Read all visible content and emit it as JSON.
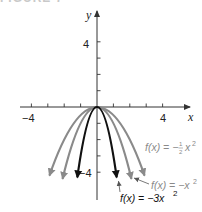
{
  "header": {
    "title": "FIGURE 7"
  },
  "colors": {
    "axis": "#333333",
    "dark_curve": "#111111",
    "gray_curve": "#8a8a8a",
    "gray_label": "#8a8a8a",
    "dark_label": "#111111"
  },
  "chart_data": {
    "type": "line",
    "title": "FIGURE 7",
    "xlabel": "x",
    "ylabel": "y",
    "xlim": [
      -5.5,
      6
    ],
    "ylim": [
      -5.5,
      6
    ],
    "x_ticks": [
      -4,
      -3,
      -2,
      -1,
      1,
      2,
      3,
      4
    ],
    "x_tick_labels": {
      "-4": "−4",
      "4": "4"
    },
    "y_ticks": [
      -4,
      -3,
      -2,
      -1,
      1,
      2,
      3,
      4
    ],
    "y_tick_labels": {
      "-4": "−4",
      "4": "4"
    },
    "grid": false,
    "series": [
      {
        "name": "f(x) = −3x²",
        "coefficient": -3,
        "x_range": [
          -1.2,
          1.2
        ],
        "color": "#111111",
        "width": 2.2,
        "label": {
          "text_prefix": "f(x) = −3x",
          "sup": "2"
        }
      },
      {
        "name": "f(x) = −x²",
        "coefficient": -1,
        "x_range": [
          -2.1,
          2.1
        ],
        "color": "#8a8a8a",
        "width": 2.2,
        "label": {
          "text_prefix": "f(x) = −x",
          "sup": "2"
        }
      },
      {
        "name": "f(x) = −½x²",
        "coefficient": -0.5,
        "x_range": [
          -2.9,
          2.9
        ],
        "color": "#8a8a8a",
        "width": 2.2,
        "label": {
          "text_prefix": "f(x) = −",
          "frac": "½",
          "suffix": "x",
          "sup": "2"
        }
      }
    ]
  },
  "labels": {
    "y_axis": "y",
    "x_axis": "x",
    "tick_pos4_y": "4",
    "tick_neg4_y": "−4",
    "tick_pos4_x": "4",
    "tick_neg4_x": "−4",
    "fn_half": {
      "prefix": "f(x) = −",
      "num": "1",
      "den": "2",
      "var": "x",
      "sup": "2"
    },
    "fn_one": {
      "prefix": "f(x) = −x",
      "sup": "2"
    },
    "fn_three": {
      "prefix": "f(x) = −3x",
      "sup": "2"
    }
  }
}
